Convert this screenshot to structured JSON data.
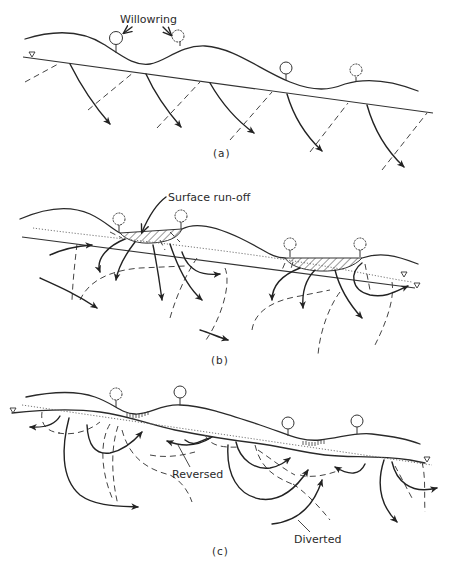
{
  "figure": {
    "panels": [
      {
        "id": "a",
        "label": "(a)",
        "annotations": [
          {
            "text": "Willowring",
            "target": "trees"
          }
        ]
      },
      {
        "id": "b",
        "label": "(b)",
        "annotations": [
          {
            "text": "Surface run-off",
            "target": "hatched-ponded-area"
          }
        ]
      },
      {
        "id": "c",
        "label": "(c)",
        "annotations": [
          {
            "text": "Reversed",
            "target": "reversed-flow-arrow"
          },
          {
            "text": "Diverted",
            "target": "diverted-flow-arrow"
          }
        ]
      }
    ],
    "legend_symbols": {
      "water_table": "inverted-triangle",
      "flow_line": "solid-arrow",
      "equipotential": "dashed-line",
      "water_table_line": "dotted-line",
      "tree": "willow-tree-icon"
    },
    "colors": {
      "ink": "#2a2a2a",
      "background": "#ffffff"
    }
  }
}
